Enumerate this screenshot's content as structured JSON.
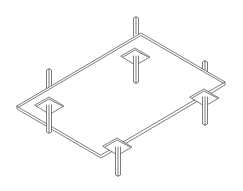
{
  "figure": {
    "type": "isometric line drawing",
    "colors": {
      "background": "#ffffff",
      "line": "#444444"
    },
    "components": {
      "plate": {
        "count": 1
      },
      "posts_with_pads": {
        "count": 4
      },
      "upper_posts": {
        "count": 3
      }
    }
  }
}
